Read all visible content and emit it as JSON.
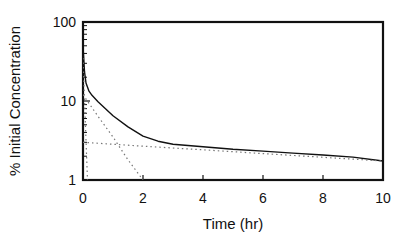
{
  "chart_data": {
    "type": "line",
    "title": "",
    "xlabel": "Time (hr)",
    "ylabel": "% Initial Concentration",
    "xlim": [
      0,
      10
    ],
    "ylim": [
      1,
      100
    ],
    "yscale": "log",
    "grid": false,
    "legend": null,
    "x_ticks": [
      "0",
      "2",
      "4",
      "6",
      "8",
      "10"
    ],
    "y_ticks": [
      "1",
      "10",
      "100"
    ],
    "series": [
      {
        "name": "Total concentration",
        "style": "solid",
        "x": [
          0,
          0.05,
          0.1,
          0.2,
          0.3,
          0.5,
          0.75,
          1,
          1.5,
          2,
          2.5,
          3,
          4,
          5,
          6,
          7,
          8,
          9,
          10
        ],
        "values": [
          50,
          23.5,
          16.9,
          13.3,
          11.8,
          9.8,
          8.0,
          6.5,
          4.7,
          3.6,
          3.1,
          2.84,
          2.63,
          2.45,
          2.32,
          2.19,
          2.07,
          1.95,
          1.74
        ]
      },
      {
        "name": "Fast phase (extrapolated)",
        "style": "dotted",
        "x": [
          0,
          0.05,
          0.1,
          0.15
        ],
        "values": [
          35,
          10.5,
          3.2,
          1.0
        ]
      },
      {
        "name": "Intermediate phase (extrapolated)",
        "style": "dotted",
        "x": [
          0,
          0.5,
          1,
          1.5,
          2
        ],
        "values": [
          12,
          6.4,
          3.5,
          1.8,
          1.0
        ]
      },
      {
        "name": "Slow phase (extrapolated)",
        "style": "dotted",
        "x": [
          0,
          2,
          4,
          6,
          8,
          10
        ],
        "values": [
          3.0,
          2.68,
          2.41,
          2.16,
          1.94,
          1.74
        ]
      }
    ]
  },
  "axes": {
    "xlabel": "Time (hr)",
    "ylabel": "% Initial Concentration"
  }
}
